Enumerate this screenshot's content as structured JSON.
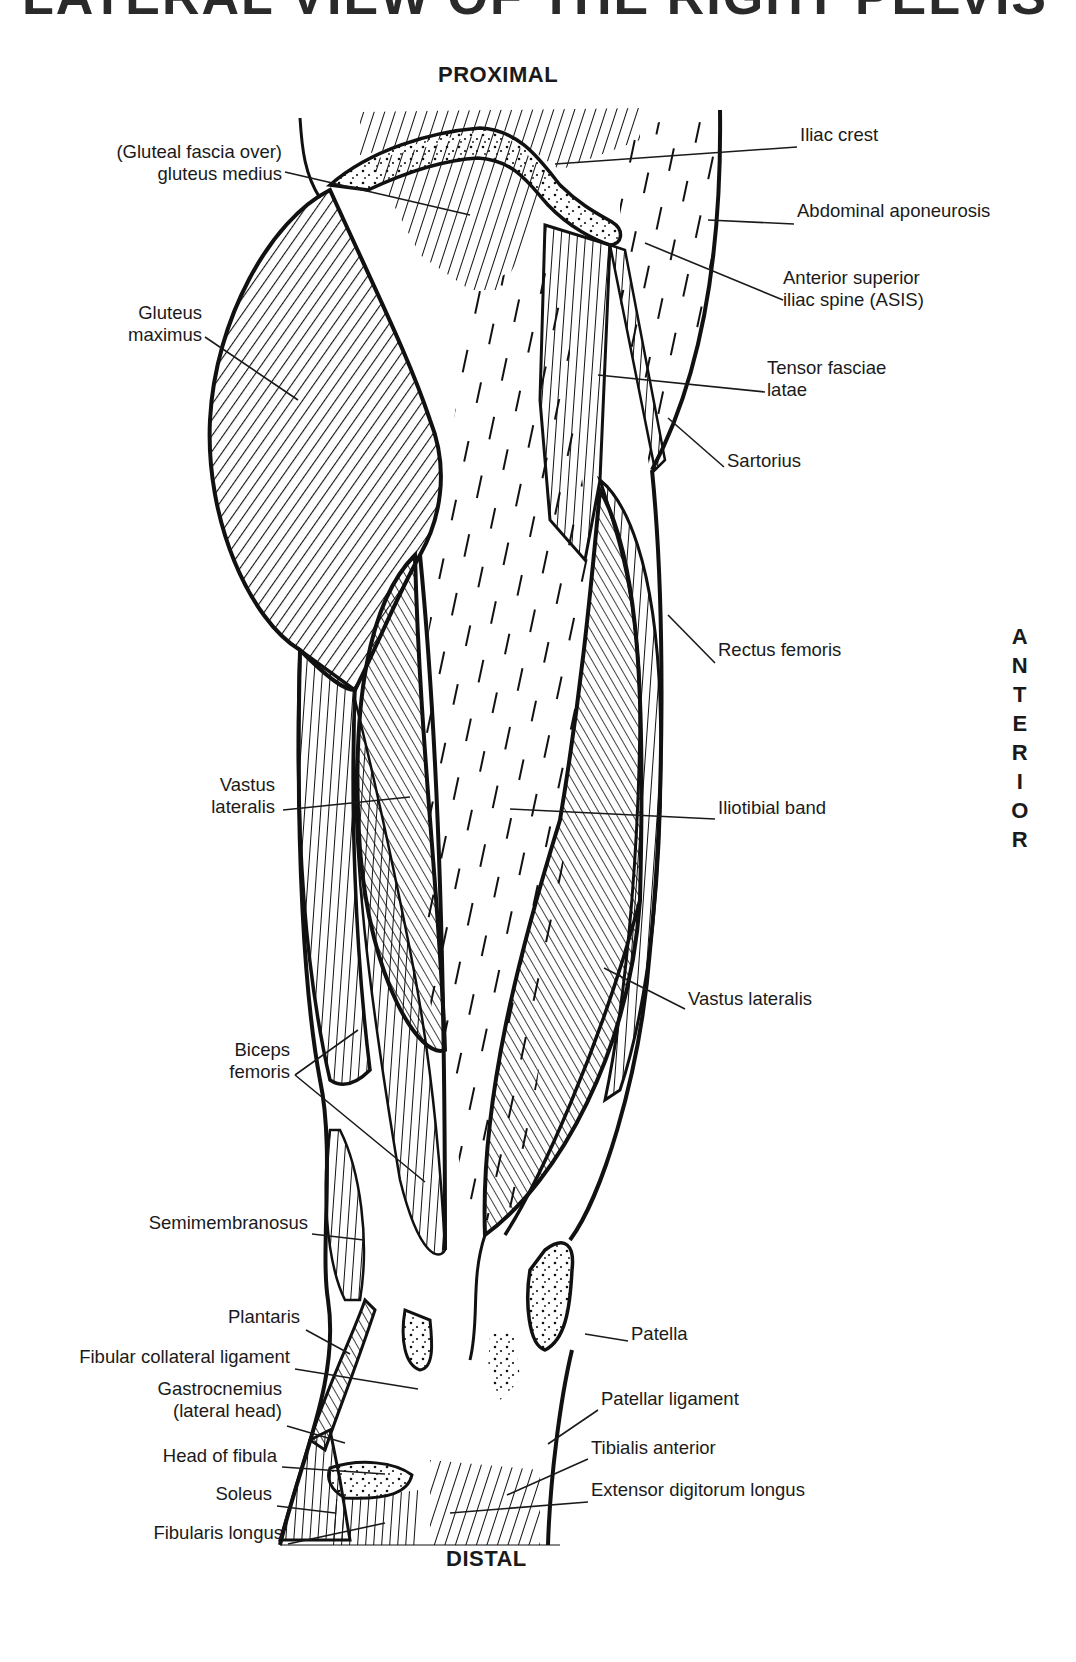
{
  "title": "LATERAL VIEW OF THE RIGHT PELVIS",
  "directions": {
    "proximal": "PROXIMAL",
    "distal": "DISTAL",
    "anterior": [
      "A",
      "N",
      "T",
      "E",
      "R",
      "I",
      "O",
      "R"
    ]
  },
  "labels_left": [
    {
      "id": "gluteal-fascia",
      "lines": [
        "(Gluteal fascia over)",
        "gluteus medius"
      ],
      "x": 282,
      "y": 152,
      "leader": [
        [
          285,
          172
        ],
        [
          470,
          215
        ]
      ]
    },
    {
      "id": "gluteus-maximus",
      "lines": [
        "Gluteus",
        "maximus"
      ],
      "x": 202,
      "y": 313,
      "leader": [
        [
          205,
          337
        ],
        [
          298,
          400
        ]
      ]
    },
    {
      "id": "vastus-lateralis-left",
      "lines": [
        "Vastus",
        "lateralis"
      ],
      "x": 275,
      "y": 785,
      "leader": [
        [
          283,
          810
        ],
        [
          410,
          797
        ]
      ]
    },
    {
      "id": "biceps-femoris",
      "lines": [
        "Biceps",
        "femoris"
      ],
      "x": 290,
      "y": 1050,
      "leader": [
        [
          295,
          1075
        ],
        [
          358,
          1030
        ],
        [
          295,
          1075
        ],
        [
          425,
          1182
        ]
      ]
    },
    {
      "id": "semimembranosus",
      "lines": [
        "Semimembranosus"
      ],
      "x": 308,
      "y": 1223,
      "leader": [
        [
          312,
          1234
        ],
        [
          364,
          1240
        ]
      ]
    },
    {
      "id": "plantaris",
      "lines": [
        "Plantaris"
      ],
      "x": 300,
      "y": 1317,
      "leader": [
        [
          306,
          1330
        ],
        [
          350,
          1354
        ]
      ]
    },
    {
      "id": "fibular-collateral-ligament",
      "lines": [
        "Fibular collateral ligament"
      ],
      "x": 290,
      "y": 1357,
      "leader": [
        [
          295,
          1369
        ],
        [
          418,
          1389
        ]
      ]
    },
    {
      "id": "gastrocnemius",
      "lines": [
        "Gastrocnemius",
        "(lateral head)"
      ],
      "x": 282,
      "y": 1389,
      "leader": [
        [
          287,
          1426
        ],
        [
          345,
          1443
        ]
      ]
    },
    {
      "id": "head-of-fibula",
      "lines": [
        "Head of fibula"
      ],
      "x": 277,
      "y": 1456,
      "leader": [
        [
          282,
          1467
        ],
        [
          385,
          1474
        ]
      ]
    },
    {
      "id": "soleus",
      "lines": [
        "Soleus"
      ],
      "x": 272,
      "y": 1494,
      "leader": [
        [
          277,
          1506
        ],
        [
          335,
          1513
        ]
      ]
    },
    {
      "id": "fibularis-longus",
      "lines": [
        "Fibularis longus"
      ],
      "x": 283,
      "y": 1533,
      "leader": [
        [
          288,
          1544
        ],
        [
          385,
          1523
        ]
      ]
    }
  ],
  "labels_right": [
    {
      "id": "iliac-crest",
      "lines": [
        "Iliac crest"
      ],
      "x": 800,
      "y": 135,
      "leader": [
        [
          797,
          147
        ],
        [
          555,
          164
        ]
      ]
    },
    {
      "id": "abdominal-aponeurosis",
      "lines": [
        "Abdominal aponeurosis"
      ],
      "x": 797,
      "y": 211,
      "leader": [
        [
          794,
          224
        ],
        [
          708,
          220
        ]
      ]
    },
    {
      "id": "asis",
      "lines": [
        "Anterior superior",
        "iliac spine (ASIS)"
      ],
      "x": 783,
      "y": 278,
      "leader": [
        [
          783,
          300
        ],
        [
          645,
          243
        ]
      ]
    },
    {
      "id": "tensor-fasciae-latae",
      "lines": [
        "Tensor fasciae",
        "latae"
      ],
      "x": 767,
      "y": 368,
      "leader": [
        [
          765,
          392
        ],
        [
          598,
          375
        ]
      ]
    },
    {
      "id": "sartorius",
      "lines": [
        "Sartorius"
      ],
      "x": 727,
      "y": 461,
      "leader": [
        [
          724,
          467
        ],
        [
          668,
          418
        ]
      ]
    },
    {
      "id": "rectus-femoris",
      "lines": [
        "Rectus femoris"
      ],
      "x": 718,
      "y": 650,
      "leader": [
        [
          715,
          663
        ],
        [
          668,
          615
        ]
      ]
    },
    {
      "id": "iliotibial-band",
      "lines": [
        "Iliotibial band"
      ],
      "x": 718,
      "y": 808,
      "leader": [
        [
          715,
          819
        ],
        [
          510,
          809
        ]
      ]
    },
    {
      "id": "vastus-lateralis-right",
      "lines": [
        "Vastus lateralis"
      ],
      "x": 688,
      "y": 999,
      "leader": [
        [
          685,
          1009
        ],
        [
          604,
          968
        ]
      ]
    },
    {
      "id": "patella",
      "lines": [
        "Patella"
      ],
      "x": 631,
      "y": 1334,
      "leader": [
        [
          628,
          1341
        ],
        [
          585,
          1334
        ]
      ]
    },
    {
      "id": "patellar-ligament",
      "lines": [
        "Patellar ligament"
      ],
      "x": 601,
      "y": 1399,
      "leader": [
        [
          598,
          1410
        ],
        [
          548,
          1444
        ]
      ]
    },
    {
      "id": "tibialis-anterior",
      "lines": [
        "Tibialis anterior"
      ],
      "x": 591,
      "y": 1448,
      "leader": [
        [
          588,
          1459
        ],
        [
          507,
          1495
        ]
      ]
    },
    {
      "id": "extensor-digitorum-longus",
      "lines": [
        "Extensor digitorum longus"
      ],
      "x": 591,
      "y": 1490,
      "leader": [
        [
          588,
          1502
        ],
        [
          450,
          1513
        ]
      ]
    }
  ]
}
